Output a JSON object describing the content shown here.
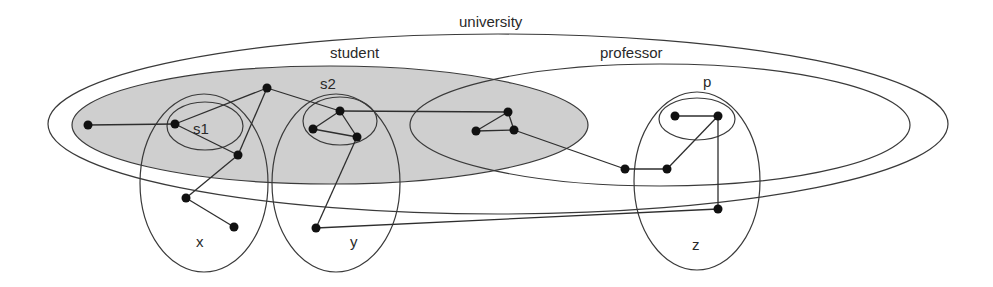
{
  "diagram": {
    "labels": {
      "university": "university",
      "student": "student",
      "professor": "professor",
      "s1": "s1",
      "s2": "s2",
      "p": "p",
      "x": "x",
      "y": "y",
      "z": "z"
    },
    "colors": {
      "student_fill": "#cfcfcf",
      "stroke": "#3a3a3a",
      "node": "#111111",
      "background": "#ffffff"
    },
    "regions": [
      {
        "id": "university",
        "cx": 498,
        "cy": 124,
        "rx": 450,
        "ry": 90
      },
      {
        "id": "student",
        "cx": 330,
        "cy": 125,
        "rx": 258,
        "ry": 59,
        "filled": true
      },
      {
        "id": "professor",
        "cx": 660,
        "cy": 125,
        "rx": 250,
        "ry": 61
      },
      {
        "id": "s1",
        "cx": 205,
        "cy": 126,
        "rx": 38,
        "ry": 24
      },
      {
        "id": "s2",
        "cx": 340,
        "cy": 121,
        "rx": 37,
        "ry": 24
      },
      {
        "id": "p",
        "cx": 697,
        "cy": 119,
        "rx": 38,
        "ry": 21
      },
      {
        "id": "x",
        "cx": 204,
        "cy": 183,
        "rx": 64,
        "ry": 89
      },
      {
        "id": "y",
        "cx": 336,
        "cy": 183,
        "rx": 64,
        "ry": 89
      },
      {
        "id": "z",
        "cx": 697,
        "cy": 181,
        "rx": 63,
        "ry": 89
      }
    ],
    "nodes": [
      {
        "id": "n1",
        "x": 88,
        "y": 125
      },
      {
        "id": "s1a",
        "x": 175,
        "y": 124
      },
      {
        "id": "t",
        "x": 267,
        "y": 88
      },
      {
        "id": "s1b",
        "x": 238,
        "y": 155
      },
      {
        "id": "x1",
        "x": 186,
        "y": 198
      },
      {
        "id": "x2",
        "x": 234,
        "y": 227
      },
      {
        "id": "s2a",
        "x": 340,
        "y": 111
      },
      {
        "id": "s2b",
        "x": 313,
        "y": 129
      },
      {
        "id": "s2c",
        "x": 357,
        "y": 137
      },
      {
        "id": "y1",
        "x": 316,
        "y": 228
      },
      {
        "id": "m1",
        "x": 508,
        "y": 112
      },
      {
        "id": "m2",
        "x": 476,
        "y": 131
      },
      {
        "id": "m3",
        "x": 514,
        "y": 130
      },
      {
        "id": "o1",
        "x": 625,
        "y": 169
      },
      {
        "id": "o2",
        "x": 667,
        "y": 169
      },
      {
        "id": "p1",
        "x": 675,
        "y": 116
      },
      {
        "id": "p2",
        "x": 718,
        "y": 116
      },
      {
        "id": "z1",
        "x": 718,
        "y": 209
      }
    ],
    "edges": [
      [
        "n1",
        "s1a"
      ],
      [
        "s1a",
        "t"
      ],
      [
        "s1a",
        "s1b"
      ],
      [
        "t",
        "s1b"
      ],
      [
        "s1b",
        "x1"
      ],
      [
        "x1",
        "x2"
      ],
      [
        "t",
        "s2a"
      ],
      [
        "s2a",
        "s2b"
      ],
      [
        "s2b",
        "s2c"
      ],
      [
        "s2a",
        "s2c"
      ],
      [
        "s2c",
        "y1"
      ],
      [
        "s2a",
        "m1"
      ],
      [
        "m1",
        "m2"
      ],
      [
        "m2",
        "m3"
      ],
      [
        "m1",
        "m3"
      ],
      [
        "m3",
        "o1"
      ],
      [
        "o1",
        "o2"
      ],
      [
        "o2",
        "p2"
      ],
      [
        "p1",
        "p2"
      ],
      [
        "p2",
        "z1"
      ],
      [
        "y1",
        "z1"
      ]
    ]
  }
}
